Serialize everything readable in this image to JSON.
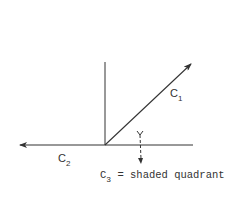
{
  "diagram": {
    "colors": {
      "background": "#ffffff",
      "stroke": "#333333"
    },
    "origin": {
      "x": 105,
      "y": 145
    },
    "vectors": [
      {
        "id": "c1",
        "label": "C",
        "subscript": "1",
        "direction": "up-right",
        "from": [
          105,
          145
        ],
        "to": [
          192,
          63
        ]
      },
      {
        "id": "c2",
        "label": "C",
        "subscript": "2",
        "direction": "left",
        "from": [
          105,
          145
        ],
        "to": [
          19,
          145
        ]
      }
    ],
    "axes": {
      "vertical": {
        "from": [
          105,
          62
        ],
        "to": [
          105,
          145
        ]
      },
      "horizontal_right": {
        "from": [
          105,
          145
        ],
        "to": [
          193,
          145
        ]
      }
    },
    "rotation_arrow": {
      "style": "dashed",
      "direction": "down",
      "x": 140,
      "from_y": 131,
      "to_y": 163
    },
    "caption": {
      "symbol": "C",
      "subscript": "3",
      "text": " = shaded quadrant"
    }
  }
}
